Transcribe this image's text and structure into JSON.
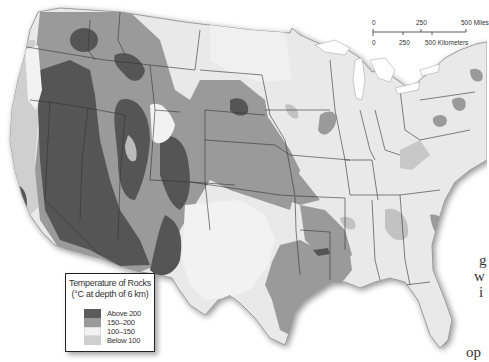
{
  "map": {
    "subject": "Temperature of rocks at 6 km depth, contiguous United States",
    "colors": {
      "above_200": "#5a5a5a",
      "150_200": "#9a9a9a",
      "100_150": "#efefef",
      "below_100": "#c8c8c8",
      "land_base": "#e9e9e9",
      "water": "#ffffff",
      "border": "#333333"
    }
  },
  "legend": {
    "title_line1": "Temperature of Rocks",
    "title_line2": "(°C at depth of 6 km)",
    "items": [
      {
        "label": "Above 200",
        "color": "#5a5a5a"
      },
      {
        "label": "150–200",
        "color": "#9a9a9a"
      },
      {
        "label": "100–150",
        "color": "#f2f2f2"
      },
      {
        "label": "Below 100",
        "color": "#cfcfcf"
      }
    ]
  },
  "scale_bar": {
    "miles": {
      "ticks": [
        "0",
        "250",
        "500 Miles"
      ]
    },
    "kilometers": {
      "ticks": [
        "0",
        "250",
        "500 Kilometers"
      ]
    }
  },
  "stray_text": {
    "g": "g",
    "w": "w",
    "i": "i",
    "op": "op"
  }
}
